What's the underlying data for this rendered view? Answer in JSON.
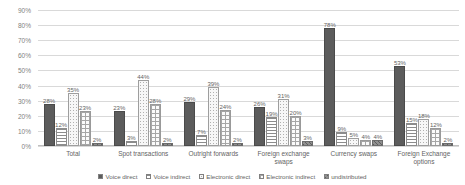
{
  "chart_data": {
    "type": "bar",
    "title": "",
    "subtitle": "",
    "xlabel": "",
    "ylabel": "",
    "ylim": [
      0,
      90
    ],
    "ytick_labels": [
      "90%",
      "80%",
      "70%",
      "60%",
      "50%",
      "40%",
      "30%",
      "20%",
      "10%",
      "0%"
    ],
    "ytick_values": [
      90,
      80,
      70,
      60,
      50,
      40,
      30,
      20,
      10,
      0
    ],
    "grid": true,
    "legend_position": "bottom",
    "categories": [
      "Total",
      "Spot transactions",
      "Outright forwards",
      "Foreign exchange swaps",
      "Currency swaps",
      "Foreign Exchange options"
    ],
    "series": [
      {
        "name": "Voice direct",
        "pattern": "solid-dark",
        "values": [
          28,
          23,
          29,
          26,
          78,
          53
        ],
        "labels": [
          "28%",
          "23%",
          "29%",
          "26%",
          "78%",
          "53%"
        ]
      },
      {
        "name": "Voice indirect",
        "pattern": "horizontal-lines",
        "values": [
          12,
          3,
          7,
          19,
          9,
          15
        ],
        "labels": [
          "12%",
          "3%",
          "7%",
          "19%",
          "9%",
          "15%"
        ]
      },
      {
        "name": "Electronic direct",
        "pattern": "dotted-light",
        "values": [
          35,
          44,
          39,
          31,
          5,
          18
        ],
        "labels": [
          "35%",
          "44%",
          "39%",
          "31%",
          "5%",
          "18%"
        ]
      },
      {
        "name": "Electronic indirect",
        "pattern": "crosshatch-grid",
        "values": [
          23,
          28,
          24,
          20,
          4,
          12
        ],
        "labels": [
          "23%",
          "28%",
          "24%",
          "20%",
          "4%",
          "12%"
        ]
      },
      {
        "name": "undistributed",
        "pattern": "dense-dark-hatch",
        "values": [
          2,
          2,
          2,
          3,
          4,
          2
        ],
        "labels": [
          "2%",
          "2%",
          "2%",
          "3%",
          "4%",
          "2%"
        ]
      }
    ],
    "colors": {
      "series_1": "#5c5c5c",
      "series_2": "#8c8c8c",
      "series_3": "#b0b0b0",
      "series_4": "#a6a6a6",
      "series_5": "#8f8f8f",
      "gridline": "#d9d9d9",
      "text": "#636363",
      "background": "#ffffff"
    }
  }
}
